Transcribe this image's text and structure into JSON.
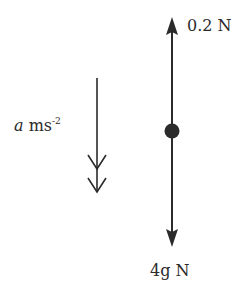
{
  "diagram": {
    "type": "force-diagram",
    "colors": {
      "ink": "#2b2b2b",
      "background": "#ffffff"
    },
    "forces": [
      {
        "name": "upward-force",
        "direction": "up",
        "magnitude": "0.2",
        "unit": "N",
        "label": "0.2 N"
      },
      {
        "name": "weight",
        "direction": "down",
        "magnitude": "4g",
        "unit": "N",
        "label_italic": "4g",
        "label_unit": "N"
      }
    ],
    "acceleration": {
      "direction": "down",
      "symbol": "a",
      "unit_base": "ms",
      "unit_exponent": "-2"
    },
    "particle": {
      "shape": "dot"
    }
  }
}
